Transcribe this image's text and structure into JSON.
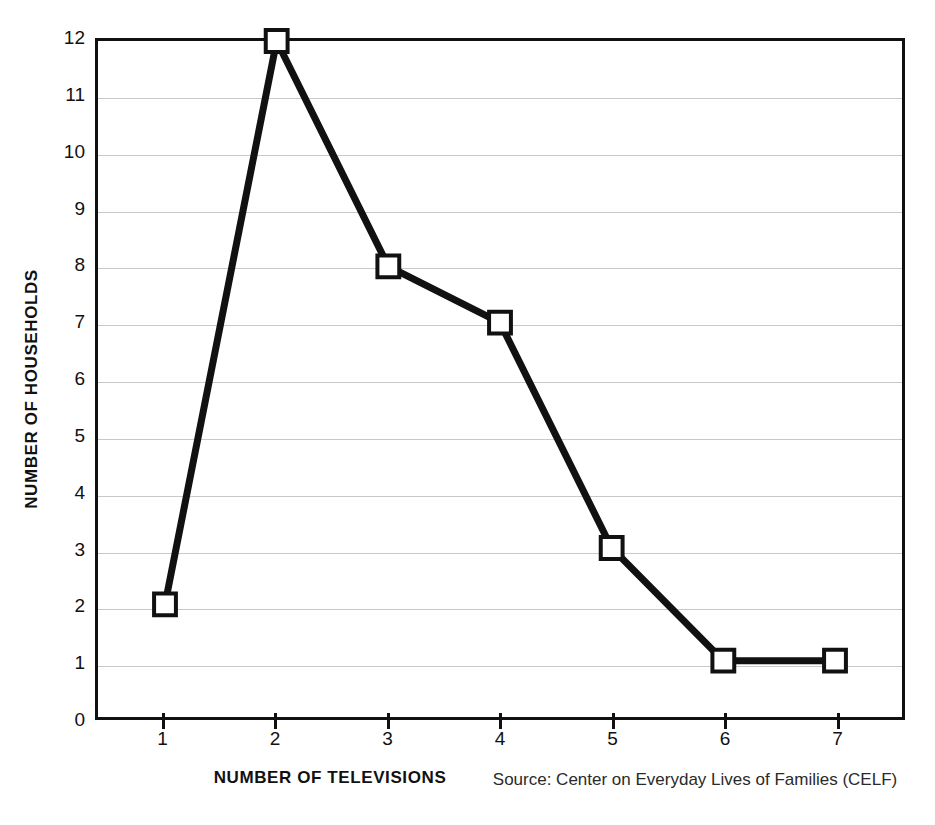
{
  "chart_data": {
    "type": "line",
    "title": "",
    "xlabel": "NUMBER OF TELEVISIONS",
    "ylabel": "NUMBER OF HOUSEHOLDS",
    "x": [
      1,
      2,
      3,
      4,
      5,
      6,
      7
    ],
    "values": [
      2,
      12,
      8,
      7,
      3,
      1,
      1
    ],
    "series": [
      {
        "name": "Number of households",
        "values": [
          2,
          12,
          8,
          7,
          3,
          1,
          1
        ]
      }
    ],
    "xtick_labels": [
      "1",
      "2",
      "3",
      "4",
      "5",
      "6",
      "7"
    ],
    "ytick_labels": [
      "0",
      "1",
      "2",
      "3",
      "4",
      "5",
      "6",
      "7",
      "8",
      "9",
      "10",
      "11",
      "12"
    ],
    "xlim": [
      0.4,
      7.6
    ],
    "ylim": [
      0,
      12
    ],
    "grid": "horizontal",
    "legend": "none",
    "marker": "open-square",
    "line_color": "#111111",
    "marker_fill": "#ffffff",
    "marker_edge": "#111111",
    "gridline_color": "#c9c9c9",
    "axis_color": "#111111",
    "background": "#ffffff",
    "source": "Source: Center on Everyday Lives of Families (CELF)"
  }
}
